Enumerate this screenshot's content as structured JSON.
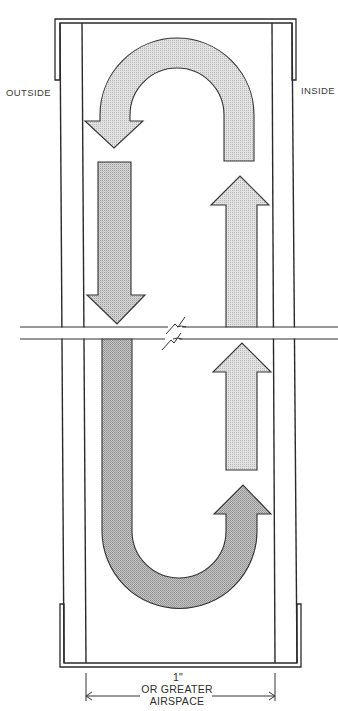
{
  "diagram": {
    "labels": {
      "outside": "OUTSIDE",
      "inside": "INSIDE"
    },
    "dimension": {
      "value": "1\"",
      "line1": "OR GREATER",
      "line2": "AIRSPACE"
    },
    "airflow_arrows": [
      {
        "id": "top-u-turn",
        "shape": "u-turn",
        "direction": "up along inside face, over, down toward outside face",
        "shade": "light"
      },
      {
        "id": "down-upper",
        "shape": "straight",
        "direction": "down",
        "side": "outside",
        "shade": "medium"
      },
      {
        "id": "up-upper",
        "shape": "straight",
        "direction": "up",
        "side": "inside",
        "shade": "light"
      },
      {
        "id": "up-lower",
        "shape": "straight",
        "direction": "up",
        "side": "inside",
        "shade": "light"
      },
      {
        "id": "bottom-u-turn",
        "shape": "u-turn",
        "direction": "down along outside face, under, up toward inside face",
        "shade": "dark"
      }
    ],
    "colors": {
      "line": "#2a2a2a",
      "fill_light": "#d9d9d9",
      "fill_medium": "#c7c7c7",
      "fill_dark": "#b3b3b3",
      "background": "#ffffff"
    }
  }
}
